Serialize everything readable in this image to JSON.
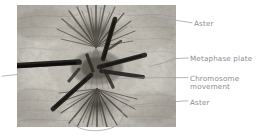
{
  "figure": {
    "kind": "annotated-light-micrograph",
    "leader_line_color": "#9a9ca3",
    "label_text_color": "#8b8d93",
    "background_color": "#ffffff"
  },
  "micrograph": {
    "alt": "grayscale micrograph of a dividing cell showing two asters and dark chromosomes",
    "frame": {
      "left": 17,
      "top": 5,
      "width": 159,
      "height": 122
    },
    "tone_light": "#d9d6cf",
    "tone_mid": "#a9a49b",
    "tone_dark": "#2b2a28"
  },
  "annotations": [
    {
      "id": "aster-top",
      "label": "Aster",
      "lines": [
        "Aster"
      ],
      "leader": {
        "from_x": 192,
        "from_y": 23,
        "to_x": 150,
        "to_y": 17
      }
    },
    {
      "id": "metaphase-plate",
      "label": "Metaphase plate",
      "lines": [
        "Metaphase plate"
      ],
      "leader": {
        "from_x": 188,
        "from_y": 58,
        "to_x": 148,
        "to_y": 66
      }
    },
    {
      "id": "chromosome-movement",
      "label": "Chromosome movement",
      "lines": [
        "Chromosome",
        "movement"
      ],
      "leader": {
        "from_x": 188,
        "from_y": 78,
        "to_x": 112,
        "to_y": 78
      }
    },
    {
      "id": "aster-bottom",
      "label": "Aster",
      "lines": [
        "Aster"
      ],
      "leader": {
        "from_x": 188,
        "from_y": 101,
        "to_x": 120,
        "to_y": 107
      }
    }
  ]
}
